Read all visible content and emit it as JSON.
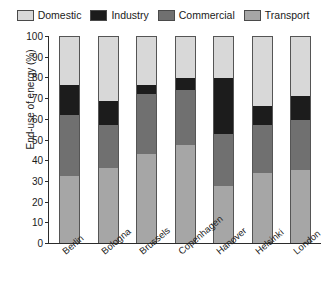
{
  "chart_data": {
    "type": "bar",
    "subtype": "stacked-bar-100",
    "title": "",
    "xlabel": "",
    "ylabel": "End-use of energy (%)",
    "ylim": [
      0,
      100
    ],
    "ytick_step": 10,
    "yticks": [
      0,
      10,
      20,
      30,
      40,
      50,
      60,
      70,
      80,
      90,
      100
    ],
    "grid": false,
    "legend_position": "top",
    "stack_order_bottom_to_top": [
      "Transport",
      "Commercial",
      "Industry",
      "Domestic"
    ],
    "categories": [
      "Berlin",
      "Bologna",
      "Brussels",
      "Copenhagen",
      "Hanover",
      "Helsinki",
      "London"
    ],
    "series": [
      {
        "name": "Transport",
        "color": "#a6a6a6",
        "values": [
          32.5,
          36,
          43,
          47.5,
          27.5,
          34,
          35.5
        ]
      },
      {
        "name": "Commercial",
        "color": "#707070",
        "values": [
          29.5,
          21,
          29,
          26.5,
          25,
          23,
          24
        ]
      },
      {
        "name": "Industry",
        "color": "#1c1c1c",
        "values": [
          14.5,
          11.5,
          4.5,
          5.5,
          27,
          9,
          11.5
        ]
      },
      {
        "name": "Domestic",
        "color": "#d8d8d8",
        "values": [
          23.5,
          31.5,
          23.5,
          20.5,
          20.5,
          34,
          29
        ]
      }
    ],
    "cumulative_tops": {
      "Berlin": {
        "Transport": 32.5,
        "Commercial": 62,
        "Industry": 76.5,
        "Domestic": 100
      },
      "Bologna": {
        "Transport": 36,
        "Commercial": 57,
        "Industry": 68.5,
        "Domestic": 100
      },
      "Brussels": {
        "Transport": 43,
        "Commercial": 72,
        "Industry": 76.5,
        "Domestic": 100
      },
      "Copenhagen": {
        "Transport": 47.5,
        "Commercial": 74,
        "Industry": 79.5,
        "Domestic": 100
      },
      "Hanover": {
        "Transport": 27.5,
        "Commercial": 52.5,
        "Industry": 79.5,
        "Domestic": 100
      },
      "Helsinki": {
        "Transport": 34,
        "Commercial": 57,
        "Industry": 66,
        "Domestic": 100
      },
      "London": {
        "Transport": 35.5,
        "Commercial": 59.5,
        "Industry": 71,
        "Domestic": 100
      }
    }
  },
  "legend": {
    "entries": [
      {
        "label": "Domestic",
        "color": "#d8d8d8"
      },
      {
        "label": "Industry",
        "color": "#1c1c1c"
      },
      {
        "label": "Commercial",
        "color": "#707070"
      },
      {
        "label": "Transport",
        "color": "#a6a6a6"
      }
    ]
  }
}
